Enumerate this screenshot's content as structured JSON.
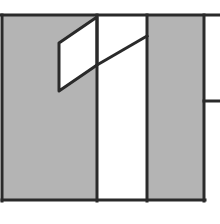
{
  "diagram": {
    "width": 220,
    "height": 224,
    "colors": {
      "background": "#ffffff",
      "fill_gray": "#b4b4b4",
      "fill_white": "#ffffff",
      "stroke": "#2a2a2a"
    },
    "stroke_width": 3,
    "regions": [
      {
        "name": "left-gray-panel",
        "x": 3,
        "y": 16,
        "w": 94,
        "h": 184,
        "fill": "fill_gray"
      },
      {
        "name": "center-white-column",
        "x": 97,
        "y": 16,
        "w": 50,
        "h": 184,
        "fill": "fill_white"
      },
      {
        "name": "right-gray-panel",
        "x": 147,
        "y": 16,
        "w": 57,
        "h": 184,
        "fill": "fill_gray"
      }
    ],
    "parallelogram": {
      "name": "slanted-white-parallelogram",
      "points": [
        [
          97,
          17
        ],
        [
          59,
          43
        ],
        [
          59,
          91
        ],
        [
          97,
          65
        ]
      ],
      "fill": "fill_white"
    },
    "lines": [
      {
        "name": "top-edge-line",
        "x1": 0,
        "y1": 15,
        "x2": 220,
        "y2": 15
      },
      {
        "name": "left-edge-line",
        "x1": 2,
        "y1": 15,
        "x2": 2,
        "y2": 201
      },
      {
        "name": "bottom-edge-line",
        "x1": 2,
        "y1": 200,
        "x2": 205,
        "y2": 200
      },
      {
        "name": "divider-line-1",
        "x1": 97,
        "y1": 15,
        "x2": 97,
        "y2": 201
      },
      {
        "name": "divider-line-2",
        "x1": 147,
        "y1": 15,
        "x2": 147,
        "y2": 201
      },
      {
        "name": "right-edge-line",
        "x1": 204,
        "y1": 15,
        "x2": 204,
        "y2": 201
      },
      {
        "name": "right-stub-line",
        "x1": 204,
        "y1": 101,
        "x2": 220,
        "y2": 101
      },
      {
        "name": "diagonal-extension-line",
        "x1": 97,
        "y1": 65,
        "x2": 147,
        "y2": 36
      }
    ]
  }
}
